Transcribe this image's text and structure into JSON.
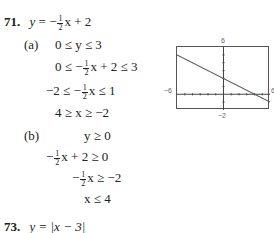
{
  "problem71": {
    "number": "71.",
    "equation": {
      "lhs": "y",
      "eq": "=",
      "sign": "−",
      "frac_num": "1",
      "frac_den": "2",
      "rest": "x + 2"
    },
    "part_a": {
      "label": "(a)",
      "steps": [
        {
          "text_before": "0 ≤ y ≤ 3"
        },
        {
          "pre": "0 ≤ −",
          "frac_num": "1",
          "frac_den": "2",
          "post": "x + 2 ≤ 3"
        },
        {
          "pre": "−2 ≤ −",
          "frac_num": "1",
          "frac_den": "2",
          "post": "x ≤ 1"
        },
        {
          "text_before": "4 ≥ x ≥ −2"
        }
      ]
    },
    "part_b": {
      "label": "(b)",
      "steps": [
        {
          "text_before": "y ≥ 0"
        },
        {
          "pre": "−",
          "frac_num": "1",
          "frac_den": "2",
          "post": "x + 2 ≥ 0"
        },
        {
          "pre": "−",
          "frac_num": "1",
          "frac_den": "2",
          "post": "x ≥ −2"
        },
        {
          "text_before": "x ≤ 4"
        }
      ]
    }
  },
  "graph": {
    "xmin_label": "−6",
    "xmax_label": "6",
    "ymax_label": "6",
    "ymin_label": "−2",
    "window": {
      "xmin": -6,
      "xmax": 6,
      "ymin": -2,
      "ymax": 6
    },
    "line": {
      "slope": -0.5,
      "intercept": 2
    }
  },
  "problem73": {
    "number": "73.",
    "equation": "y = |x − 3|"
  }
}
